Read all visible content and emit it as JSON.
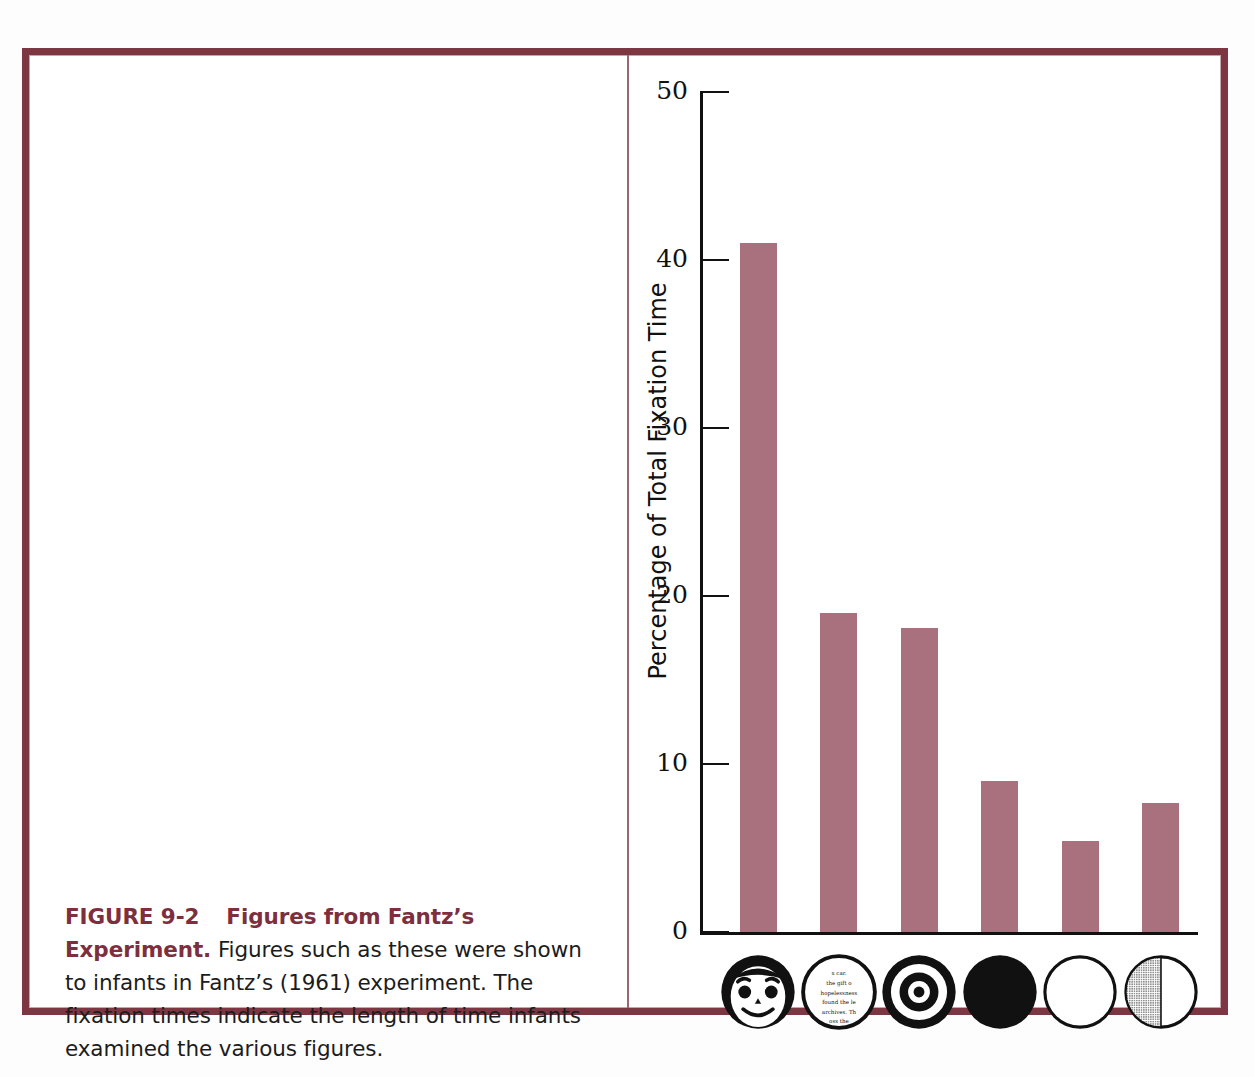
{
  "figure": {
    "label": "FIGURE 9-2",
    "title": "Figures from Fantz’s Experiment.",
    "caption_body": "Figures such as these were shown to infants in Fantz’s (1961) experiment. The fixation times indicate the length of time infants examined the various figures."
  },
  "colors": {
    "frame": "#7d3742",
    "frame_hairline": "#c9a5ab",
    "divider": "#9d6670",
    "bar": "#a9707e",
    "axis": "#111111",
    "caption_heading": "#7d2f3e",
    "caption_body": "#1c1c1c",
    "icon_ink": "#111111",
    "icon_shade": "#6e6e6e"
  },
  "chart_data": {
    "type": "bar",
    "title": "",
    "xlabel": "",
    "ylabel": "Percentage of Total Fixation Time",
    "ylim": [
      0,
      50
    ],
    "yticks": [
      0,
      10,
      20,
      30,
      40,
      50
    ],
    "ytick_labels": [
      "0",
      "10",
      "20",
      "30",
      "40",
      "50"
    ],
    "grid": false,
    "legend": "none",
    "categories": [
      "face",
      "newsprint",
      "bullseye",
      "black circle",
      "white circle",
      "half-shaded circle"
    ],
    "values": [
      41,
      19,
      18.1,
      9,
      5.4,
      7.7
    ],
    "bar_color": "#a9707e"
  },
  "stimuli": [
    {
      "name": "face-stimulus",
      "icon": "smiley-face-circle-icon"
    },
    {
      "name": "newsprint-stimulus",
      "icon": "newsprint-circle-icon"
    },
    {
      "name": "bullseye-stimulus",
      "icon": "bullseye-circle-icon"
    },
    {
      "name": "black-stimulus",
      "icon": "solid-black-circle-icon"
    },
    {
      "name": "white-stimulus",
      "icon": "outline-white-circle-icon"
    },
    {
      "name": "half-shaded-stimulus",
      "icon": "half-shaded-circle-icon"
    }
  ],
  "newsprint_lines": [
    "x car.",
    "the gift o",
    "hopelessness",
    "found the le",
    "archives.  Th",
    "oss the"
  ]
}
